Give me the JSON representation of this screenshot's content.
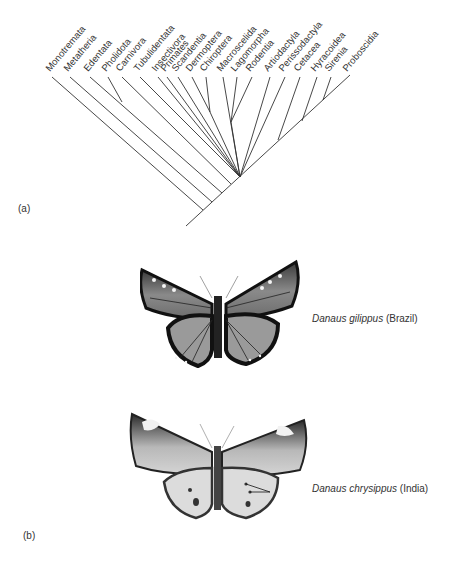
{
  "panel_a": {
    "label": "(a)",
    "taxa": [
      {
        "name": "Monotremata",
        "x": 52
      },
      {
        "name": "Metatheria",
        "x": 70
      },
      {
        "name": "Edentata",
        "x": 90
      },
      {
        "name": "Pholidota",
        "x": 108
      },
      {
        "name": "Carnivora",
        "x": 122
      },
      {
        "name": "Tubulidentata",
        "x": 140
      },
      {
        "name": "Insectivora",
        "x": 158
      },
      {
        "name": "Primates",
        "x": 167
      },
      {
        "name": "Scandentia",
        "x": 178
      },
      {
        "name": "Dermoptera",
        "x": 192
      },
      {
        "name": "Chiroptera",
        "x": 206
      },
      {
        "name": "Macroscelida",
        "x": 223
      },
      {
        "name": "Lagomorpha",
        "x": 237
      },
      {
        "name": "Rodentia",
        "x": 252
      },
      {
        "name": "Artiodactyla",
        "x": 270
      },
      {
        "name": "Perissodactyla",
        "x": 285
      },
      {
        "name": "Cetacea",
        "x": 300
      },
      {
        "name": "Hyracoidea",
        "x": 317
      },
      {
        "name": "Sirenia",
        "x": 331
      },
      {
        "name": "Proboscidia",
        "x": 349
      }
    ]
  },
  "panel_b": {
    "label": "(b)",
    "specimens": [
      {
        "genus_species": "Danaus gilippus",
        "locality": "(Brazil)"
      },
      {
        "genus_species": "Danaus chrysippus",
        "locality": "(India)"
      }
    ]
  }
}
